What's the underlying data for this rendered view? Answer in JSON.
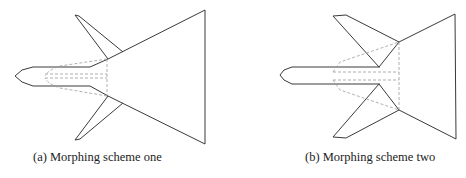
{
  "figure": {
    "panels": [
      {
        "id": "a",
        "caption": "(a) Morphing scheme one",
        "subject": "aircraft planform with swept wing and delta tail, hidden internal structure shown dashed"
      },
      {
        "id": "b",
        "caption": "(b) Morphing scheme two",
        "subject": "aircraft planform with wing folded rearward, hidden internal structure shown dashed"
      }
    ],
    "colors": {
      "outline": "#3a3a3a",
      "hidden_line": "#9a9a9a",
      "background": "#ffffff"
    }
  }
}
